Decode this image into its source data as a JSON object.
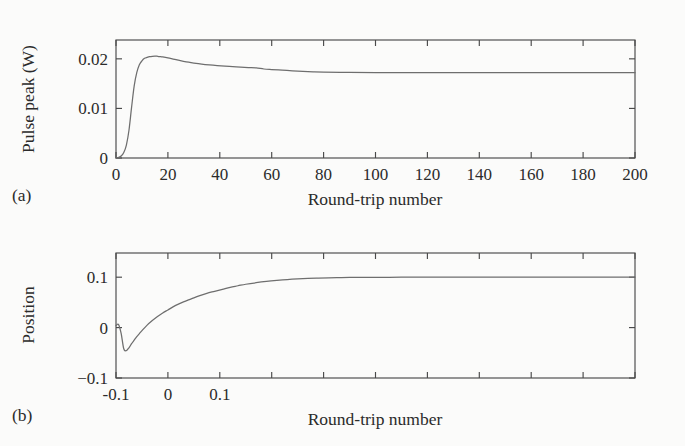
{
  "figure": {
    "background_color": "#fbfbfa",
    "curve_color": "#6e6e6e",
    "axis_color": "#4a4a4a",
    "text_color": "#2b2b2b"
  },
  "panels": [
    {
      "tag": "(a)",
      "xlabel": "Round-trip number",
      "ylabel": "Pulse peak (W)"
    },
    {
      "tag": "(b)",
      "xlabel": "Round-trip number",
      "ylabel": "Position"
    }
  ],
  "chart_data": [
    {
      "type": "line",
      "title": "",
      "panel": "(a)",
      "xlabel": "Round-trip number",
      "ylabel": "Pulse peak (W)",
      "xlim": [
        0,
        200
      ],
      "ylim": [
        0,
        0.0238
      ],
      "xticks": [
        0,
        20,
        40,
        60,
        80,
        100,
        120,
        140,
        160,
        180,
        200
      ],
      "yticks": [
        0,
        0.01,
        0.02
      ],
      "xtick_labels": [
        "0",
        "20",
        "40",
        "60",
        "80",
        "100",
        "120",
        "140",
        "160",
        "180",
        "200"
      ],
      "ytick_labels": [
        "0",
        "0.01",
        "0.02"
      ],
      "grid": false,
      "legend": false,
      "series": [
        {
          "name": "pulse peak",
          "x": [
            0,
            1,
            2,
            3,
            4,
            5,
            6,
            7,
            8,
            9,
            10,
            11,
            12,
            13,
            14,
            15,
            16,
            17,
            18,
            20,
            22,
            24,
            26,
            28,
            30,
            33,
            36,
            39,
            42,
            45,
            48,
            51,
            54,
            57,
            60,
            64,
            68,
            72,
            76,
            80,
            90,
            100,
            110,
            120,
            130,
            140,
            150,
            160,
            170,
            180,
            190,
            200
          ],
          "y": [
            0.0,
            0.00012,
            0.0004,
            0.0011,
            0.0026,
            0.0056,
            0.0102,
            0.0145,
            0.0172,
            0.0188,
            0.0196,
            0.0201,
            0.0203,
            0.02045,
            0.02052,
            0.02055,
            0.02052,
            0.02046,
            0.02038,
            0.02018,
            0.01995,
            0.01972,
            0.01951,
            0.01932,
            0.01916,
            0.01895,
            0.01878,
            0.01864,
            0.01852,
            0.01841,
            0.01832,
            0.01824,
            0.01817,
            0.01795,
            0.01784,
            0.01772,
            0.01757,
            0.01746,
            0.01738,
            0.01733,
            0.01726,
            0.01723,
            0.01722,
            0.01721,
            0.01721,
            0.01721,
            0.01721,
            0.01721,
            0.01721,
            0.01721,
            0.01721,
            0.01721
          ]
        }
      ]
    },
    {
      "type": "line",
      "title": "",
      "panel": "(b)",
      "xlabel": "Round-trip number",
      "ylabel": "Position",
      "xlim": [
        0,
        200
      ],
      "ylim": [
        -0.1,
        0.148
      ],
      "xticks": [
        0,
        20,
        40,
        60,
        80,
        100,
        120,
        140,
        160,
        180,
        200
      ],
      "yticks": [
        -0.1,
        0,
        0.1
      ],
      "xtick_labels": [
        "-0.1",
        "0",
        "0.1"
      ],
      "ytick_labels": [
        "0.1",
        "0",
        "-0.1"
      ],
      "grid": false,
      "legend": false,
      "series": [
        {
          "name": "position",
          "x": [
            0,
            1,
            2,
            3,
            4,
            5,
            6,
            7,
            8,
            9,
            10,
            12,
            14,
            16,
            18,
            20,
            23,
            26,
            29,
            32,
            35,
            38,
            41,
            44,
            47,
            50,
            54,
            58,
            62,
            66,
            70,
            74,
            78,
            82,
            86,
            90,
            100,
            110,
            120,
            130,
            140,
            150,
            160,
            170,
            180,
            190,
            200
          ],
          "y": [
            0.004,
            0.006,
            -0.012,
            -0.042,
            -0.0455,
            -0.04,
            -0.032,
            -0.025,
            -0.018,
            -0.012,
            -0.006,
            0.005,
            0.014,
            0.022,
            0.029,
            0.035,
            0.044,
            0.051,
            0.057,
            0.063,
            0.068,
            0.072,
            0.076,
            0.08,
            0.083,
            0.086,
            0.089,
            0.0915,
            0.0935,
            0.0952,
            0.0965,
            0.0975,
            0.0982,
            0.0988,
            0.0992,
            0.0995,
            0.0998,
            0.0999,
            0.0999,
            0.0999,
            0.0999,
            0.0999,
            0.0999,
            0.0999,
            0.0999,
            0.0999,
            0.0999
          ]
        }
      ]
    }
  ]
}
